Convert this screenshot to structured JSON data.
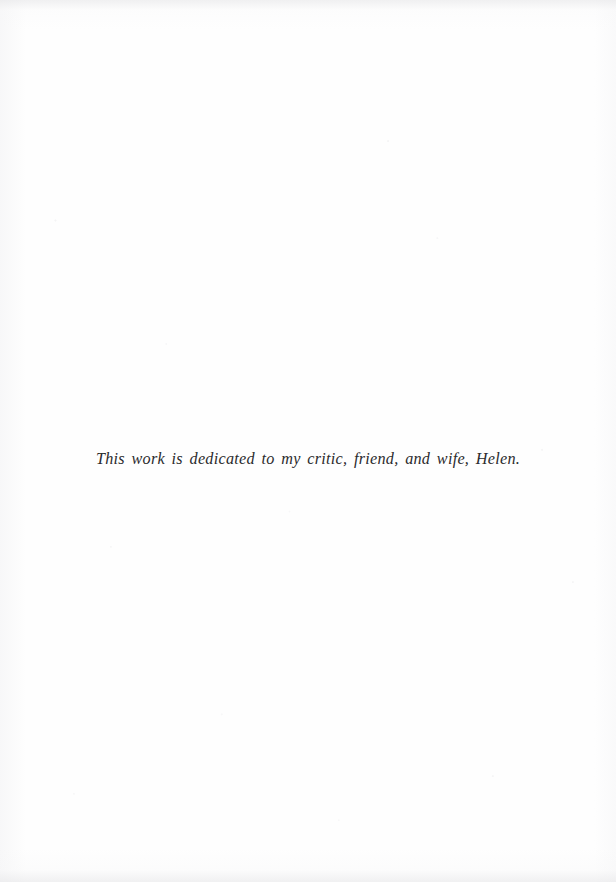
{
  "page": {
    "kind": "book-dedication-page",
    "background_color": "#fefefe",
    "ink_color": "#2b2b2d"
  },
  "dedication": {
    "text": "This work is dedicated to my critic, friend, and wife, Helen."
  }
}
